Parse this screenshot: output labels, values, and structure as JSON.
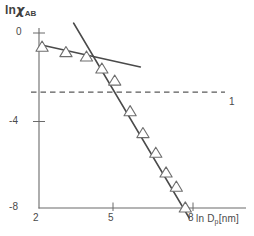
{
  "figure": {
    "background": "#ffffff",
    "axis_color": "#6b6b6b",
    "line_color": "#4a4a4a",
    "marker_color": "#6e6e6e",
    "dash_color": "#5a5a5a"
  },
  "labels": {
    "ylabel_prefix": "ln",
    "ylabel_symbol": "χ",
    "ylabel_subscript": "AB",
    "xlabel_prefix": "ln D",
    "xlabel_subscript": "p",
    "xlabel_units": "[nm]",
    "annotation_1": "1"
  },
  "ticks": {
    "y": [
      "0",
      "-4",
      "-8"
    ],
    "x": [
      "2",
      "5",
      "8"
    ]
  },
  "chart_data": {
    "type": "scatter",
    "title": "",
    "xlabel": "ln D_p [nm]",
    "ylabel": "ln χ_AB",
    "xlim": [
      2,
      8.3
    ],
    "ylim": [
      -8.6,
      0.6
    ],
    "xticks": [
      2,
      5,
      8
    ],
    "yticks": [
      0,
      -4,
      -8
    ],
    "grid": false,
    "legend": false,
    "marker": "open-triangle",
    "series": [
      {
        "name": "ln χ_AB data",
        "x": [
          2.12,
          3.05,
          3.85,
          4.45,
          4.95,
          5.55,
          6.05,
          6.55,
          6.95,
          7.35,
          7.7
        ],
        "y": [
          -0.6,
          -0.85,
          -1.05,
          -1.6,
          -2.15,
          -3.55,
          -4.55,
          -5.45,
          -6.35,
          -7.0,
          -7.95
        ]
      }
    ],
    "fits": [
      {
        "name": "shallow-regime fit",
        "x": [
          2.1,
          5.95
        ],
        "y": [
          -0.55,
          -1.55
        ],
        "slope": -0.26
      },
      {
        "name": "steep-regime fit",
        "x": [
          3.35,
          7.85
        ],
        "y": [
          0.45,
          -8.45
        ],
        "slope": -1.98
      }
    ],
    "reference_lines": [
      {
        "name": "threshold",
        "orientation": "horizontal",
        "y": -2.7,
        "style": "dashed",
        "label": "1"
      }
    ]
  }
}
